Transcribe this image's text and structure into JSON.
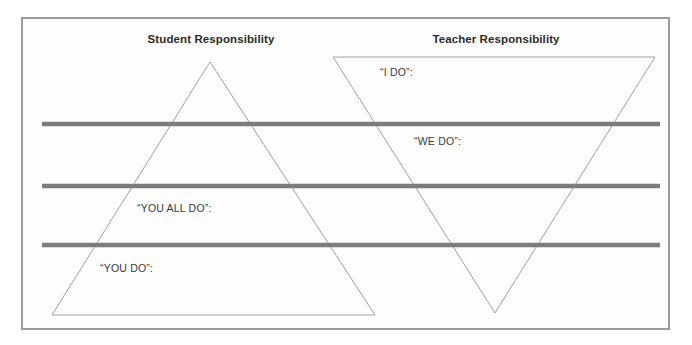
{
  "diagram": {
    "type": "gradual-release-of-responsibility",
    "background_color": "#fdfdfd",
    "frame_color": "#9a9a9a",
    "bar_color": "#7b7c7e",
    "triangle_stroke_color": "#9ea0a4",
    "text_color": "#2b2b2b"
  },
  "columns": {
    "student": {
      "title": "Student Responsibility"
    },
    "teacher": {
      "title": "Teacher Responsibility"
    }
  },
  "phases": [
    {
      "key": "i_do",
      "label": "“I DO”:"
    },
    {
      "key": "we_do",
      "label": "“WE DO”:"
    },
    {
      "key": "you_all_do",
      "label": "“YOU ALL DO”:"
    },
    {
      "key": "you_do",
      "label": "“YOU DO”:"
    }
  ],
  "shapes": {
    "student_triangle": {
      "name": "upright-triangle",
      "points": "210,62 375,315 52,315"
    },
    "teacher_triangle": {
      "name": "inverted-triangle",
      "points": "333,57 655,57 495,313"
    },
    "divider_bars": [
      {
        "x1": 42,
        "y1": 124,
        "x2": 660,
        "y2": 124
      },
      {
        "x1": 42,
        "y1": 186,
        "x2": 660,
        "y2": 186
      },
      {
        "x1": 42,
        "y1": 245,
        "x2": 660,
        "y2": 245
      }
    ]
  }
}
